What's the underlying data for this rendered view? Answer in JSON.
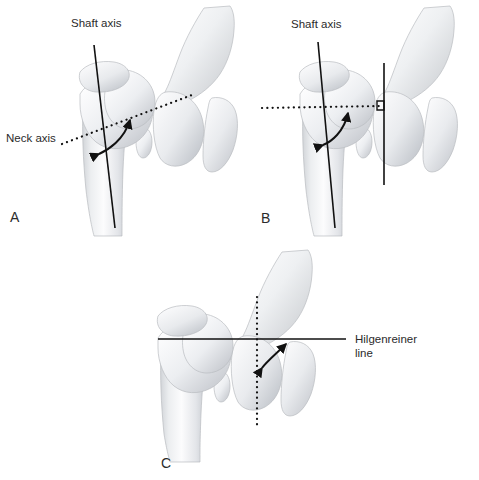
{
  "figure": {
    "background_color": "#ffffff",
    "line_color": "#111111",
    "bone_fill_light": "#fbfbfc",
    "bone_fill_shadow": "#c9ccd1",
    "label_color": "#2b2b2b",
    "panels": [
      {
        "id": "A",
        "letter": "A",
        "labels": [
          {
            "name": "shaft-axis",
            "text": "Shaft axis"
          },
          {
            "name": "neck-axis",
            "text": "Neck axis"
          }
        ],
        "annotations": {
          "angle_arrow": "double-headed curved arrow between neck axis and shaft axis",
          "solid_lines": 1,
          "dotted_lines": 1
        }
      },
      {
        "id": "B",
        "letter": "B",
        "labels": [
          {
            "name": "shaft-axis",
            "text": "Shaft axis"
          }
        ],
        "annotations": {
          "angle_arrow": "double-headed curved arrow between horizontal dotted line and shaft axis",
          "solid_lines": 2,
          "dotted_lines": 1,
          "right_angle_marker": true
        }
      },
      {
        "id": "C",
        "letter": "C",
        "labels": [
          {
            "name": "hilgenreiner-line",
            "text_line1": "Hilgenreiner",
            "text_line2": "line"
          }
        ],
        "annotations": {
          "angle_arrow": "double-headed curved arrow between vertical dotted line and Hilgenreiner line",
          "solid_lines": 1,
          "dotted_lines": 1
        }
      }
    ]
  }
}
